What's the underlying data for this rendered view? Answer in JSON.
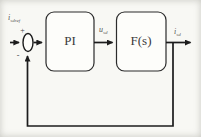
{
  "diagram": {
    "input_label": {
      "base": "i",
      "sub": "sdref"
    },
    "control_label": {
      "base": "u",
      "sub": "sd"
    },
    "output_label": {
      "base": "i",
      "sub": "sd"
    },
    "sum": {
      "plus": "+",
      "minus": "-"
    },
    "blocks": [
      {
        "id": "pi",
        "label": "PI"
      },
      {
        "id": "fs",
        "label": "F(s)"
      }
    ],
    "colors": {
      "background": "#f8f8f4",
      "line": "#1c1c1c",
      "block_border": "#2b2b2b",
      "block_fill": "#fdfdfa",
      "label_text": "#555550"
    }
  }
}
